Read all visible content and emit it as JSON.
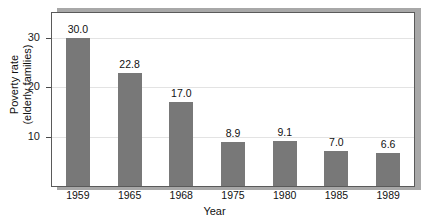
{
  "chart_data": {
    "type": "bar",
    "title": "",
    "subtitle": "",
    "xlabel": "Year",
    "ylabel_line1": "Poverty rate",
    "ylabel_line2": "(elderly families)",
    "categories": [
      "1959",
      "1965",
      "1968",
      "1975",
      "1980",
      "1985",
      "1989"
    ],
    "values": [
      30.0,
      22.8,
      17.0,
      8.9,
      9.1,
      7.0,
      6.6
    ],
    "value_labels": [
      "30.0",
      "22.8",
      "17.0",
      "8.9",
      "9.1",
      "7.0",
      "6.6"
    ],
    "ytick_labels": [
      "10",
      "20",
      "30"
    ],
    "ytick_values": [
      10,
      20,
      30
    ],
    "ylim": [
      0,
      35
    ],
    "grid": true,
    "legend": "none",
    "bar_color": "#787878",
    "frame_color": "#5a5a5a",
    "gridline_color": "#e3e3e3",
    "shadow_color": "#a8a8a8",
    "background_color": "#ffffff"
  }
}
